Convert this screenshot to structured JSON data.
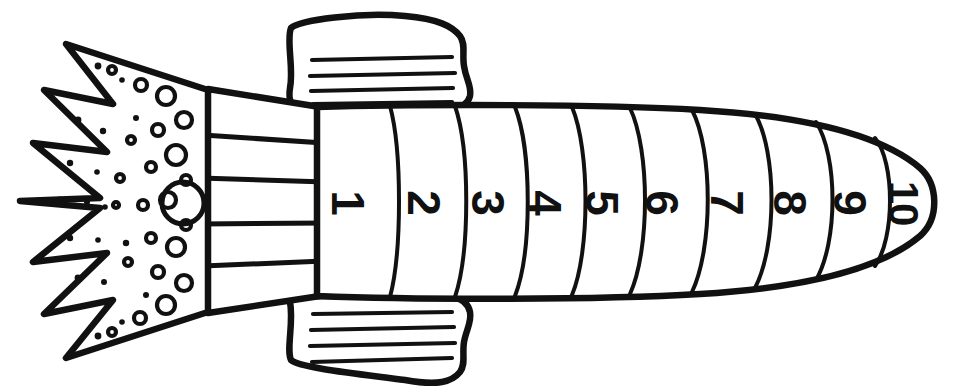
{
  "page": {
    "background_color": "#ffffff",
    "ink_color": "#111111",
    "width": 977,
    "height": 390
  },
  "artwork": {
    "subject": "rocket",
    "style": "black-and-white line art coloring page",
    "orientation": "pointing right",
    "parts": [
      {
        "name": "nose-cone",
        "label": "Nose cone"
      },
      {
        "name": "body",
        "label": "Rocket body"
      },
      {
        "name": "top-fin",
        "label": "Top fin"
      },
      {
        "name": "bottom-fin",
        "label": "Bottom fin"
      },
      {
        "name": "nozzle",
        "label": "Engine nozzle"
      },
      {
        "name": "flame",
        "label": "Exhaust flame"
      }
    ]
  },
  "body_segments": {
    "count": 10,
    "labels": [
      "1",
      "2",
      "3",
      "4",
      "5",
      "6",
      "7",
      "8",
      "9",
      "10"
    ],
    "label_rotation_degrees": 90,
    "positions": [
      {
        "label": "1",
        "cx": 348,
        "cy": 203
      },
      {
        "label": "2",
        "cx": 424,
        "cy": 203
      },
      {
        "label": "3",
        "cx": 488,
        "cy": 203
      },
      {
        "label": "4",
        "cx": 545,
        "cy": 203
      },
      {
        "label": "5",
        "cx": 602,
        "cy": 203
      },
      {
        "label": "6",
        "cx": 662,
        "cy": 203
      },
      {
        "label": "7",
        "cx": 727,
        "cy": 203
      },
      {
        "label": "8",
        "cx": 790,
        "cy": 203
      },
      {
        "label": "9",
        "cx": 850,
        "cy": 203
      },
      {
        "label": "10",
        "cx": 903,
        "cy": 203
      }
    ]
  },
  "fins": {
    "top": {
      "hatch_line_count": 4
    },
    "bottom": {
      "hatch_line_count": 4
    }
  },
  "nozzle": {
    "band_count": 5,
    "divider_count": 4
  },
  "flame": {
    "zigzag_point_count": 6,
    "large_circle": {
      "cx": 183,
      "cy": 203,
      "r": 21
    },
    "ring_count": 22,
    "speck_count": 18
  }
}
